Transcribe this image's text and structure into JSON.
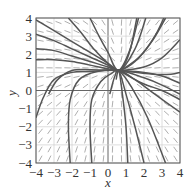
{
  "chart_data": {
    "type": "line",
    "subtype": "direction-field",
    "title": "",
    "xlabel": "x",
    "ylabel": "y",
    "xlim": [
      -4,
      4
    ],
    "ylim": [
      -4,
      4
    ],
    "xticks": [
      "-4",
      "-3",
      "-2",
      "-1",
      "0",
      "1",
      "2",
      "3",
      "4"
    ],
    "yticks": [
      "-4",
      "-3",
      "-2",
      "-1",
      "0",
      "1",
      "2",
      "3",
      "4"
    ],
    "grid": true,
    "legend": null,
    "pinch_point": {
      "x": 0.6,
      "y": 1.1
    },
    "series": [
      {
        "name": "solution-1",
        "points": [
          [
            -4,
            3.9
          ],
          [
            -3,
            3.3
          ],
          [
            -2,
            2.7
          ],
          [
            -1,
            2.1
          ],
          [
            0,
            1.5
          ],
          [
            0.6,
            1.1
          ],
          [
            1.0,
            1.6
          ],
          [
            1.3,
            2.5
          ],
          [
            1.6,
            4
          ]
        ]
      },
      {
        "name": "solution-2",
        "points": [
          [
            -2.2,
            4
          ],
          [
            -1.5,
            3.2
          ],
          [
            -0.8,
            2.3
          ],
          [
            0,
            1.5
          ],
          [
            0.6,
            1.1
          ],
          [
            1.2,
            2.2
          ],
          [
            1.7,
            4
          ]
        ]
      },
      {
        "name": "solution-3",
        "points": [
          [
            -1.0,
            4
          ],
          [
            -0.5,
            3.0
          ],
          [
            0,
            2.1
          ],
          [
            0.6,
            1.1
          ],
          [
            1.5,
            2.3
          ],
          [
            2.1,
            4
          ]
        ]
      },
      {
        "name": "solution-4",
        "points": [
          [
            -4,
            2.3
          ],
          [
            -3,
            2.2
          ],
          [
            -2,
            1.9
          ],
          [
            -1,
            1.6
          ],
          [
            0,
            1.3
          ],
          [
            0.6,
            1.1
          ],
          [
            1.5,
            1.6
          ],
          [
            2.5,
            2.8
          ],
          [
            3.2,
            4
          ]
        ]
      },
      {
        "name": "solution-5",
        "points": [
          [
            -4,
            1.7
          ],
          [
            -3,
            1.7
          ],
          [
            -2,
            1.6
          ],
          [
            -1,
            1.4
          ],
          [
            0,
            1.2
          ],
          [
            0.6,
            1.1
          ],
          [
            2,
            1.3
          ],
          [
            3,
            1.8
          ],
          [
            4,
            2.8
          ]
        ]
      },
      {
        "name": "solution-6",
        "points": [
          [
            -3.3,
            -0.2
          ],
          [
            -2.8,
            0.6
          ],
          [
            -2,
            1.1
          ],
          [
            -1,
            1.15
          ],
          [
            0,
            1.12
          ],
          [
            0.6,
            1.1
          ],
          [
            2,
            1.0
          ],
          [
            3,
            0.8
          ],
          [
            4,
            0.4
          ]
        ]
      },
      {
        "name": "solution-7",
        "points": [
          [
            -4,
            -1.5
          ],
          [
            -3.6,
            -0.4
          ],
          [
            -3.0,
            0.6
          ],
          [
            -2,
            1.0
          ],
          [
            -1,
            1.05
          ],
          [
            0.6,
            1.1
          ],
          [
            2,
            0.7
          ],
          [
            3,
            0.3
          ],
          [
            4,
            -0.2
          ]
        ]
      },
      {
        "name": "solution-8",
        "points": [
          [
            -2.1,
            -4
          ],
          [
            -2.2,
            -2
          ],
          [
            -2.1,
            -0.5
          ],
          [
            -1.6,
            0.6
          ],
          [
            -0.6,
            1.05
          ],
          [
            0.6,
            1.1
          ],
          [
            1.5,
            0.6
          ],
          [
            2.6,
            -0.2
          ],
          [
            4,
            -1.2
          ]
        ]
      },
      {
        "name": "solution-9",
        "points": [
          [
            -0.9,
            -4
          ],
          [
            -1.0,
            -2
          ],
          [
            -0.9,
            -0.5
          ],
          [
            -0.4,
            0.5
          ],
          [
            0.2,
            0.95
          ],
          [
            0.6,
            1.1
          ],
          [
            1.3,
            0.2
          ],
          [
            2.2,
            -1.5
          ],
          [
            3.2,
            -4
          ]
        ]
      },
      {
        "name": "solution-10",
        "points": [
          [
            0.1,
            -0.2
          ],
          [
            0.35,
            0.7
          ],
          [
            0.6,
            1.1
          ],
          [
            1.0,
            -0.2
          ],
          [
            1.5,
            -2
          ],
          [
            2.0,
            -4
          ]
        ]
      },
      {
        "name": "solution-11",
        "points": [
          [
            0.45,
            0.6
          ],
          [
            0.6,
            1.1
          ],
          [
            0.8,
            -0.2
          ],
          [
            1.0,
            -2
          ],
          [
            1.1,
            -4
          ]
        ]
      },
      {
        "name": "solution-12",
        "points": [
          [
            -4,
            3.1
          ],
          [
            -3,
            2.75
          ],
          [
            -2,
            2.3
          ],
          [
            -1,
            1.85
          ],
          [
            0,
            1.4
          ],
          [
            0.6,
            1.1
          ],
          [
            1.8,
            1.9
          ],
          [
            2.6,
            3.0
          ],
          [
            3.1,
            4
          ]
        ]
      },
      {
        "name": "solution-13",
        "points": [
          [
            0.6,
            1.1
          ],
          [
            2.5,
            0.9
          ],
          [
            3.5,
            0.9
          ],
          [
            4,
            1.0
          ]
        ]
      },
      {
        "name": "solution-14",
        "points": [
          [
            0.6,
            1.1
          ],
          [
            1.9,
            0.4
          ],
          [
            3,
            0.0
          ],
          [
            4,
            -0.5
          ]
        ]
      }
    ]
  },
  "axes": {
    "x_label": "x",
    "y_label": "y"
  }
}
